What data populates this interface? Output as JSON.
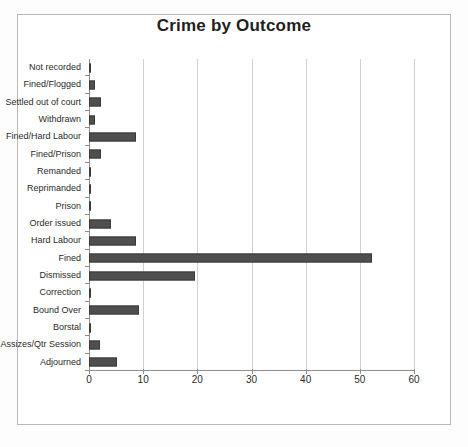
{
  "chart_data": {
    "type": "bar",
    "orientation": "horizontal",
    "title": "Crime by Outcome",
    "xlabel": "",
    "ylabel": "",
    "xlim": [
      0,
      60
    ],
    "xticks": [
      0,
      10,
      20,
      30,
      40,
      50,
      60
    ],
    "grid": true,
    "legend": false,
    "bar_color": "#4f4f4f",
    "gridline_color": "#d0d0d0",
    "axis_color": "#8e8e8e",
    "categories": [
      "Not recorded",
      "Fined/Flogged",
      "Settled out of court",
      "Withdrawn",
      "Fined/Hard Labour",
      "Fined/Prison",
      "Remanded",
      "Reprimanded",
      "Prison",
      "Order issued",
      "Hard Labour",
      "Fined",
      "Dismissed",
      "Correction",
      "Bound Over",
      "Borstal",
      "Assizes/Qtr Session",
      "Adjourned"
    ],
    "values": [
      0.4,
      1.1,
      2.2,
      1.1,
      8.6,
      2.2,
      0.3,
      0.3,
      0.3,
      4.1,
      8.6,
      52.3,
      19.5,
      0.3,
      9.3,
      0.3,
      2.1,
      5.2
    ]
  }
}
